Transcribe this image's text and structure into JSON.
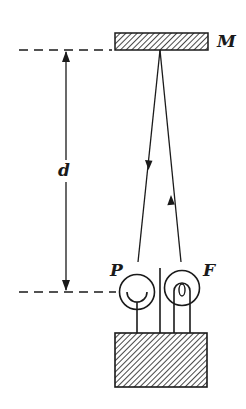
{
  "diagram": {
    "labels": {
      "mirror": "M",
      "distance": "d",
      "photocell": "P",
      "filament_lamp": "F"
    },
    "colors": {
      "ink": "#1a1a1a",
      "background": "#ffffff"
    }
  }
}
